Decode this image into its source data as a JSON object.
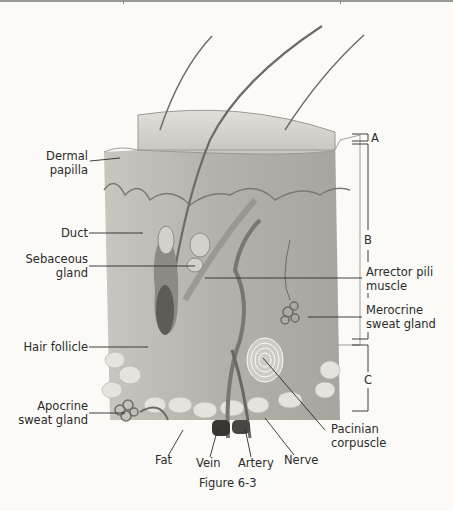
{
  "figure": {
    "caption": "Figure 6-3",
    "colors": {
      "background": "#fbfaf6",
      "tissue": "#b9b6b0",
      "epidermis": "#d9d6d0",
      "text": "#2b2b2b"
    }
  },
  "labels_left": {
    "dermal_papilla": [
      "Dermal",
      "papilla"
    ],
    "duct": "Duct",
    "sebaceous_gland": [
      "Sebaceous",
      "gland"
    ],
    "hair_follicle": "Hair follicle",
    "apocrine_sweat_gland": [
      "Apocrine",
      "sweat gland"
    ]
  },
  "labels_right": {
    "layer_a": "A",
    "layer_b": "B",
    "layer_c": "C",
    "arrector_pili_muscle": [
      "Arrector pili",
      "muscle"
    ],
    "merocrine_sweat_gland": [
      "Merocrine",
      "sweat gland"
    ],
    "pacinian_corpuscle": [
      "Pacinian",
      "corpuscle"
    ]
  },
  "labels_bottom": {
    "fat": "Fat",
    "vein": "Vein",
    "artery": "Artery",
    "nerve": "Nerve"
  }
}
